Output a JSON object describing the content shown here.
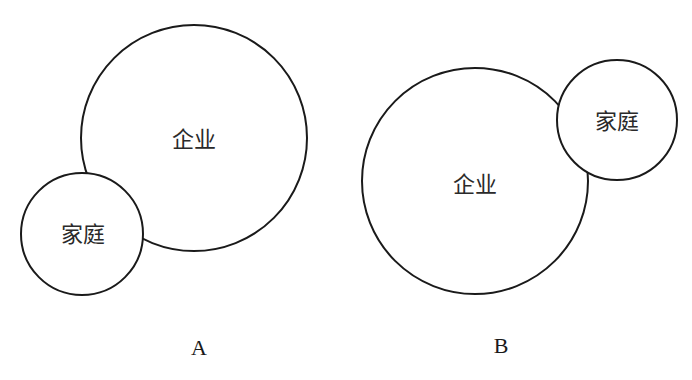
{
  "diagrams": [
    {
      "caption": "A",
      "large_circle": {
        "label": "企业",
        "cx": 194,
        "cy": 138,
        "r": 113
      },
      "small_circle": {
        "label": "家庭",
        "cx": 82,
        "cy": 234,
        "r": 61
      },
      "caption_pos": {
        "x": 199,
        "y": 355
      }
    },
    {
      "caption": "B",
      "large_circle": {
        "label": "企业",
        "cx": 475,
        "cy": 181,
        "r": 113
      },
      "small_circle": {
        "label": "家庭",
        "cx": 617,
        "cy": 120,
        "r": 60
      },
      "caption_pos": {
        "x": 501,
        "y": 353
      }
    }
  ],
  "colors": {
    "stroke": "#1a1a1a",
    "background": "#ffffff",
    "text": "#2a2a2a"
  }
}
